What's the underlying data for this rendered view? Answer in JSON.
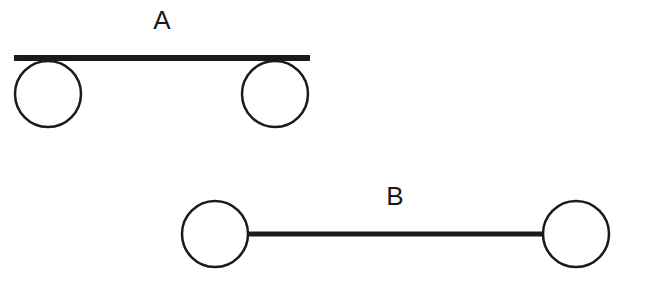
{
  "diagram": {
    "background": "#ffffff",
    "stroke_color": "#1a1a1a",
    "figures": [
      {
        "label": "A",
        "description": "bar resting on top of two circles",
        "bar": {
          "x1": 14,
          "y1": 58,
          "x2": 310,
          "y2": 58,
          "width": 6
        },
        "circles": [
          {
            "cx": 48,
            "cy": 94,
            "r": 33
          },
          {
            "cx": 275,
            "cy": 94,
            "r": 33
          }
        ],
        "label_pos": {
          "x": 162,
          "y": 29
        }
      },
      {
        "label": "B",
        "description": "bar connecting two circles at their centers level",
        "bar": {
          "x1": 249,
          "y1": 234,
          "x2": 543,
          "y2": 234,
          "width": 5
        },
        "circles": [
          {
            "cx": 215,
            "cy": 234,
            "r": 33
          },
          {
            "cx": 576,
            "cy": 234,
            "r": 33
          }
        ],
        "label_pos": {
          "x": 395,
          "y": 205
        }
      }
    ]
  }
}
